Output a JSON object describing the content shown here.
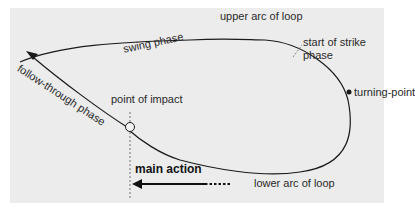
{
  "diagram": {
    "background_color": "#ececec",
    "line_color": "#1a1a1a",
    "labels": {
      "upper_arc": "upper arc of loop",
      "swing_phase": "swing phase",
      "start_strike_line1": "start of strike",
      "start_strike_line2": "phase",
      "follow_through": "follow-through phase",
      "point_of_impact": "point of impact",
      "turning_point": "turning-point",
      "main_action": "main action",
      "lower_arc": "lower arc of loop"
    },
    "nodes": [
      {
        "id": "turning-point",
        "marker": "filled-dot"
      },
      {
        "id": "point-of-impact",
        "marker": "open-circle"
      }
    ],
    "edges": [
      {
        "from": "swing-phase",
        "to": "start-of-strike-phase",
        "label": "upper arc of loop"
      },
      {
        "from": "start-of-strike-phase",
        "to": "turning-point"
      },
      {
        "from": "turning-point",
        "to": "point-of-impact",
        "label": "lower arc of loop"
      },
      {
        "from": "point-of-impact",
        "to": "follow-through-phase",
        "arrow": true
      }
    ]
  }
}
